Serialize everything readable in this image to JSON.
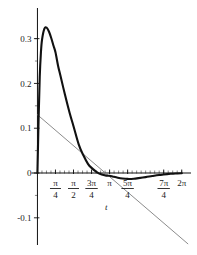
{
  "chart_data": {
    "type": "line",
    "title": "",
    "xlabel": "t",
    "ylabel": "",
    "xlim": [
      -0.15,
      6.6
    ],
    "ylim": [
      -0.125,
      0.355
    ],
    "grid": false,
    "legend": null,
    "x_tick_labels": [
      "π/4",
      "π/2",
      "3π/4",
      "π",
      "5π/4",
      "7π/4",
      "2π"
    ],
    "x_tick_values": [
      0.7854,
      1.5708,
      2.3562,
      3.1416,
      3.927,
      5.4978,
      6.2832
    ],
    "y_tick_labels": [
      "0.3",
      "0.2",
      "0.1",
      "0",
      "-0.1"
    ],
    "y_tick_values": [
      0.3,
      0.2,
      0.1,
      0,
      -0.1
    ],
    "series": [
      {
        "name": "damped-oscillation-curve",
        "style": "solid",
        "color": "#111111",
        "width": 2.1,
        "x": [
          0,
          0.05,
          0.1,
          0.15,
          0.2,
          0.3,
          0.4,
          0.5,
          0.6,
          0.7,
          0.7854,
          0.9,
          1.0,
          1.2,
          1.4,
          1.5708,
          1.8,
          2.0,
          2.2,
          2.3562,
          2.6,
          2.8,
          3.0,
          3.1416,
          3.3,
          3.5,
          3.7,
          3.927,
          4.2,
          4.4,
          4.7124,
          5.0,
          5.3,
          5.4978,
          5.8,
          6.0,
          6.2832
        ],
        "y": [
          0.0,
          0.12,
          0.215,
          0.268,
          0.298,
          0.322,
          0.3245,
          0.316,
          0.3015,
          0.284,
          0.2695,
          0.239,
          0.2175,
          0.1745,
          0.1345,
          0.1045,
          0.0635,
          0.0395,
          0.0205,
          0.0115,
          0.0015,
          -0.0035,
          -0.0058,
          -0.0063,
          -0.0082,
          -0.0105,
          -0.0122,
          -0.0132,
          -0.0128,
          -0.0115,
          -0.0092,
          -0.0068,
          -0.0045,
          -0.0034,
          -0.0018,
          -0.001,
          -0.0004
        ]
      },
      {
        "name": "tangent-reference-line",
        "style": "solid",
        "color": "#8c8c8c",
        "width": 1.0,
        "x": [
          0,
          6.55
        ],
        "y": [
          0.13,
          -0.158
        ]
      }
    ]
  },
  "axes": {
    "x_axis_name": "horizontal-axis",
    "y_axis_name": "vertical-axis",
    "minor_ticks": true,
    "axis_color": "#111111"
  }
}
